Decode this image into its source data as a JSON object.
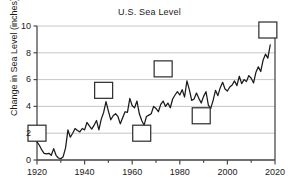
{
  "chart_data": {
    "type": "line",
    "title": "U.S. Sea Level",
    "xlabel": "",
    "ylabel": "Change in Sea Level (inches)",
    "xlim": [
      1920,
      2020
    ],
    "ylim": [
      0,
      10
    ],
    "grid": true,
    "legend": null,
    "xticks": [
      1920,
      1940,
      1960,
      1980,
      2000,
      2020
    ],
    "xtick_labels": [
      "1920",
      "1940",
      "1960",
      "1980",
      "2000",
      "2020"
    ],
    "yticks": [
      0,
      2,
      4,
      6,
      8,
      10
    ],
    "ytick_labels": [
      "0",
      "2",
      "4",
      "6",
      "8",
      "10"
    ],
    "series": [
      {
        "name": "Change in Sea Level",
        "x": [
          1920,
          1921,
          1922,
          1923,
          1924,
          1925,
          1926,
          1927,
          1928,
          1929,
          1930,
          1931,
          1932,
          1933,
          1934,
          1935,
          1936,
          1937,
          1938,
          1939,
          1940,
          1941,
          1942,
          1943,
          1944,
          1945,
          1946,
          1947,
          1948,
          1949,
          1950,
          1951,
          1952,
          1953,
          1954,
          1955,
          1956,
          1957,
          1958,
          1959,
          1960,
          1961,
          1962,
          1963,
          1964,
          1965,
          1966,
          1967,
          1968,
          1969,
          1970,
          1971,
          1972,
          1973,
          1974,
          1975,
          1976,
          1977,
          1978,
          1979,
          1980,
          1981,
          1982,
          1983,
          1984,
          1985,
          1986,
          1987,
          1988,
          1989,
          1990,
          1991,
          1992,
          1993,
          1994,
          1995,
          1996,
          1997,
          1998,
          1999,
          2000,
          2001,
          2002,
          2003,
          2004,
          2005,
          2006,
          2007,
          2008,
          2009,
          2010,
          2011,
          2012,
          2013,
          2014,
          2015,
          2016,
          2017,
          2018
        ],
        "values": [
          1.35,
          1.1,
          0.75,
          0.5,
          0.45,
          0.5,
          0.35,
          0.85,
          0.35,
          0.15,
          0.1,
          0.25,
          0.9,
          2.25,
          1.7,
          2.0,
          2.35,
          2.2,
          2.1,
          2.35,
          2.25,
          2.8,
          2.55,
          2.3,
          2.6,
          2.95,
          2.25,
          3.05,
          3.55,
          4.35,
          3.65,
          3.0,
          3.3,
          3.45,
          3.25,
          2.7,
          3.15,
          3.6,
          3.55,
          4.6,
          4.05,
          3.9,
          4.4,
          3.45,
          2.95,
          2.6,
          3.25,
          3.35,
          3.45,
          4.0,
          3.85,
          3.6,
          4.15,
          4.4,
          4.0,
          4.25,
          3.9,
          4.55,
          4.85,
          5.1,
          4.85,
          5.25,
          4.7,
          5.9,
          5.25,
          4.45,
          4.55,
          5.0,
          4.6,
          4.25,
          4.75,
          5.1,
          4.1,
          3.85,
          4.45,
          5.2,
          4.8,
          5.4,
          5.8,
          5.3,
          5.15,
          5.45,
          5.6,
          5.9,
          5.55,
          6.25,
          5.7,
          6.0,
          5.85,
          6.3,
          6.1,
          5.75,
          6.55,
          6.95,
          6.6,
          7.45,
          7.9,
          7.6,
          8.6
        ],
        "color": "#1a1a1a"
      }
    ],
    "blank_boxes": [
      {
        "name": "box-1920",
        "x": 1920,
        "y": 2.0
      },
      {
        "name": "box-1948",
        "x": 1948,
        "y": 5.2
      },
      {
        "name": "box-1964",
        "x": 1964,
        "y": 2.0
      },
      {
        "name": "box-1973",
        "x": 1973,
        "y": 6.8
      },
      {
        "name": "box-1989",
        "x": 1989,
        "y": 3.3
      },
      {
        "name": "box-2017",
        "x": 2017,
        "y": 9.7
      }
    ],
    "colors": {
      "line": "#1a1a1a",
      "grid": "#b8b8b8",
      "axis": "#4a4a4a",
      "box_stroke": "#2a2a2a",
      "box_fill": "#ffffff",
      "text": "#1a1a1a",
      "background": "#ffffff"
    }
  }
}
